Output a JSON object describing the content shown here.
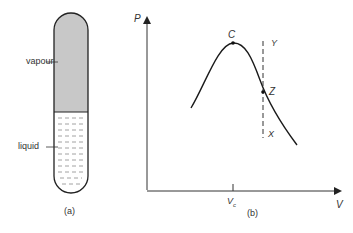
{
  "panel_a": {
    "caption": "(a)",
    "labels": {
      "vapour": "vapour",
      "liquid": "liquid"
    },
    "colors": {
      "vapour_fill": "#c8c8c8",
      "outline": "#222222",
      "liquid_dash": "#8a8a8a"
    }
  },
  "panel_b": {
    "caption": "(b)",
    "axes": {
      "y_label": "P",
      "x_label": "V"
    },
    "tick_label": "V",
    "tick_sub": "c",
    "points": {
      "critical": "C",
      "intersection": "Z",
      "top": "Y",
      "bottom": "X"
    }
  }
}
